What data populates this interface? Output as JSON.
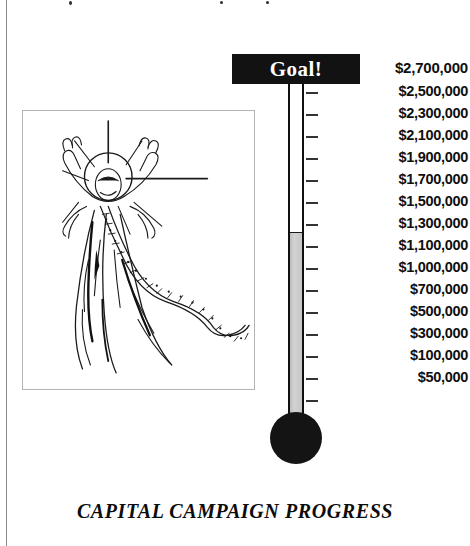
{
  "caption": "CAPITAL CAMPAIGN PROGRESS",
  "goal": {
    "banner_label": "Goal!",
    "amount_label": "$2,700,000"
  },
  "colors": {
    "banner_background": "#121212",
    "banner_text": "#ffffff",
    "mercury_fill": "#c6c6c6",
    "tube_outline": "#101010",
    "bulb": "#141414",
    "tick": "#333333",
    "frame_border": "#b4b4b4"
  },
  "illustration": {
    "name": "risen-figure-line-art",
    "description": "Line drawing of a robed figure with raised arms, halo and radiating rays"
  },
  "chart_data": {
    "type": "bar",
    "subtype": "thermometer-goal-gauge",
    "title": "CAPITAL CAMPAIGN PROGRESS",
    "xlabel": "",
    "ylabel": "",
    "orientation": "vertical",
    "grid": false,
    "legend": null,
    "goal_value": 2700000,
    "goal_label": "$2,700,000",
    "current_value": 1300000,
    "current_label": "$1,300,000",
    "fill_fraction": 0.4815,
    "ylim": [
      0,
      2700000
    ],
    "categories": [
      "Capital Campaign"
    ],
    "values": [
      1300000
    ],
    "series": [
      {
        "name": "Raised to date",
        "values": [
          1300000
        ]
      },
      {
        "name": "Campaign goal",
        "values": [
          2700000
        ]
      }
    ],
    "tick_values": [
      2700000,
      2500000,
      2300000,
      2100000,
      1900000,
      1700000,
      1500000,
      1300000,
      1100000,
      1000000,
      700000,
      500000,
      300000,
      100000,
      50000
    ],
    "tick_labels": [
      "$2,700,000",
      "$2,500,000",
      "$2,300,000",
      "$2,100,000",
      "$1,900,000",
      "$1,700,000",
      "$1,500,000",
      "$1,300,000",
      "$1,100,000",
      "$1,000,000",
      "$700,000",
      "$500,000",
      "$300,000",
      "$100,000",
      "$50,000"
    ],
    "scale_note": "Tick labels are evenly spaced on the drawing but not linearly proportional in value"
  },
  "ticks": [
    {
      "label": "$2,500,000",
      "y": 92
    },
    {
      "label": "$2,300,000",
      "y": 114
    },
    {
      "label": "$2,100,000",
      "y": 136
    },
    {
      "label": "$1,900,000",
      "y": 158
    },
    {
      "label": "$1,700,000",
      "y": 180
    },
    {
      "label": "$1,500,000",
      "y": 202
    },
    {
      "label": "$1,300,000",
      "y": 224
    },
    {
      "label": "$1,100,000",
      "y": 246
    },
    {
      "label": "$1,000,000",
      "y": 268
    },
    {
      "label": "$700,000",
      "y": 290
    },
    {
      "label": "$500,000",
      "y": 312
    },
    {
      "label": "$300,000",
      "y": 334
    },
    {
      "label": "$100,000",
      "y": 356
    },
    {
      "label": "$50,000",
      "y": 378
    }
  ],
  "extra_tick_rows": [
    400
  ],
  "fill_top_y": 233
}
